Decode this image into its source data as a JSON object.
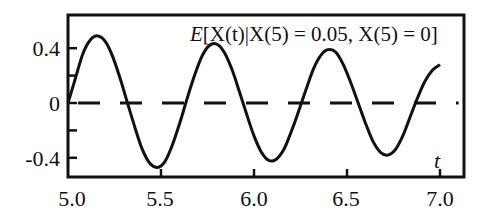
{
  "chart_data": {
    "type": "line",
    "title": "E[X(t)|X(5) = 0.05, X(5) = 0]",
    "xlabel": "t",
    "ylabel": "",
    "xlim": [
      5.0,
      7.1
    ],
    "ylim": [
      -0.55,
      0.6
    ],
    "grid": false,
    "legend": null,
    "x_ticks": [
      5.0,
      5.5,
      6.0,
      6.5,
      7.0
    ],
    "x_tick_labels": [
      "5.0",
      "5.5",
      "6.0",
      "6.5",
      "7.0"
    ],
    "y_ticks": [
      0.4,
      0.2,
      0,
      -0.2,
      -0.4
    ],
    "y_tick_labels": [
      "0.4",
      "",
      "0",
      "",
      "-0.4"
    ],
    "series": [
      {
        "name": "conditional mean",
        "style": "solid",
        "x": [
          5.0,
          5.04,
          5.08,
          5.12,
          5.16,
          5.2,
          5.24,
          5.28,
          5.32,
          5.36,
          5.4,
          5.44,
          5.48,
          5.52,
          5.56,
          5.6,
          5.64,
          5.68,
          5.72,
          5.76,
          5.8,
          5.84,
          5.88,
          5.92,
          5.96,
          6.0,
          6.04,
          6.08,
          6.12,
          6.16,
          6.2,
          6.24,
          6.28,
          6.32,
          6.36,
          6.4,
          6.44,
          6.48,
          6.52,
          6.56,
          6.6,
          6.64,
          6.68,
          6.72,
          6.76,
          6.8,
          6.84,
          6.88,
          6.92,
          6.96,
          7.0
        ],
        "values": [
          0.0,
          0.18,
          0.36,
          0.46,
          0.49,
          0.45,
          0.34,
          0.18,
          0.0,
          -0.18,
          -0.34,
          -0.44,
          -0.47,
          -0.43,
          -0.31,
          -0.15,
          0.03,
          0.2,
          0.34,
          0.42,
          0.43,
          0.37,
          0.25,
          0.09,
          -0.08,
          -0.24,
          -0.36,
          -0.42,
          -0.41,
          -0.34,
          -0.21,
          -0.06,
          0.1,
          0.25,
          0.35,
          0.39,
          0.37,
          0.28,
          0.15,
          0.0,
          -0.15,
          -0.28,
          -0.36,
          -0.38,
          -0.34,
          -0.24,
          -0.1,
          0.04,
          0.16,
          0.24,
          0.28
        ]
      },
      {
        "name": "zero line",
        "style": "dashed",
        "x": [
          5.0,
          7.1
        ],
        "values": [
          0,
          0
        ]
      }
    ]
  },
  "labels": {
    "title_E": "E",
    "title_body": "[X(t)|X(5) = 0.05, X(5) = 0]",
    "x_axis_var": "t",
    "x_ticks": [
      "5.0",
      "5.5",
      "6.0",
      "6.5",
      "7.0"
    ],
    "y_ticks": [
      "0.4",
      "0",
      "-0.4"
    ]
  }
}
